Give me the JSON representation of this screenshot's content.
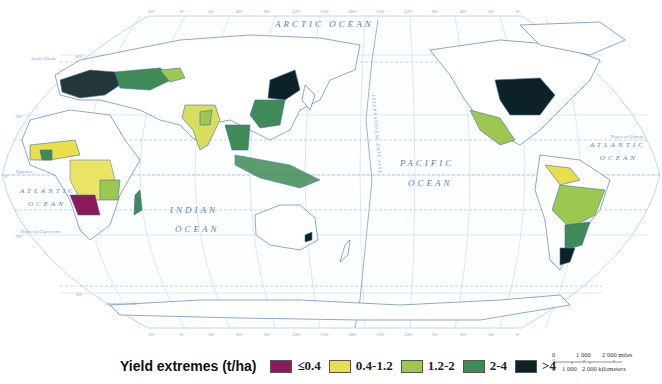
{
  "map": {
    "projection": "Robinson (Pacific-centered)",
    "oceans": [
      {
        "id": "arctic",
        "label": "ARCTIC OCEAN"
      },
      {
        "id": "pacific-1",
        "label": "PACIFIC"
      },
      {
        "id": "pacific-2",
        "label": "OCEAN"
      },
      {
        "id": "atlantic-east-1",
        "label": "ATLANTIC"
      },
      {
        "id": "atlantic-east-2",
        "label": "OCEAN"
      },
      {
        "id": "atlantic-west-1",
        "label": "ATLANTIC"
      },
      {
        "id": "atlantic-west-2",
        "label": "OCEAN"
      },
      {
        "id": "indian-1",
        "label": "INDIAN"
      },
      {
        "id": "indian-2",
        "label": "OCEAN"
      }
    ],
    "lines": {
      "arctic_circle": "Arctic Circle",
      "tropic_cancer": "Tropic of Cancer",
      "equator": "Equator",
      "tropic_capricorn": "Tropic of Capricorn",
      "antarctic_circle": "Antarctic Circle",
      "date_line": "INTERNATIONAL DATE LINE"
    },
    "lat_labels": [
      "60°",
      "30°",
      "0°",
      "30°",
      "60°"
    ],
    "lon_labels_top": [
      "30°",
      "0°",
      "30°",
      "60°",
      "90°",
      "120°",
      "150°",
      "180°",
      "150°",
      "120°",
      "90°",
      "60°",
      "30°",
      "0°"
    ],
    "lon_labels_bottom": [
      "30°",
      "0°",
      "30°",
      "60°",
      "90°",
      "120°",
      "150°",
      "180°",
      "150°",
      "120°",
      "90°",
      "60°",
      "30°",
      "0°"
    ]
  },
  "legend": {
    "title": "Yield extremes (t/ha)",
    "items": [
      {
        "label": "≤0.4",
        "color": "#8b1a5c"
      },
      {
        "label": "0.4-1.2",
        "color": "#e8df4a"
      },
      {
        "label": "1.2-2",
        "color": "#9cc852"
      },
      {
        "label": "2-4",
        "color": "#3f8a57"
      },
      {
        "label": ">4",
        "color": "#0c2226"
      }
    ]
  },
  "scale": {
    "miles_ticks": [
      "0",
      "1 000",
      "2 000 miles"
    ],
    "km_ticks": [
      "0",
      "1 000",
      "2 000 kilometers"
    ]
  },
  "colors": {
    "ocean_line": "#8fb4d6",
    "coast": "#3f6fa8",
    "border": "#222222",
    "label": "#5b7fb0"
  }
}
